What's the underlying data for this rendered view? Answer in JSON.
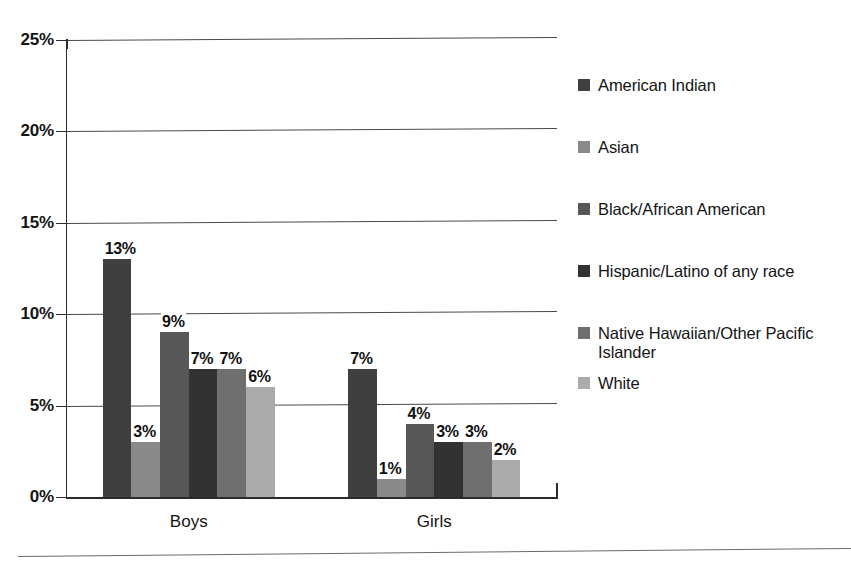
{
  "chart_data": {
    "type": "bar",
    "title": "",
    "subtitle": "",
    "xlabel": "",
    "ylabel": "",
    "categories": [
      "Boys",
      "Girls"
    ],
    "ylim": [
      0,
      25
    ],
    "ytick_values": [
      0,
      5,
      10,
      15,
      20,
      25
    ],
    "ytick_labels": [
      "0%",
      "5%",
      "10%",
      "15%",
      "20%",
      "25%"
    ],
    "grid": true,
    "grid_axis": "y",
    "legend_position": "right",
    "value_suffix": "%",
    "series": [
      {
        "name": "American Indian",
        "color": "#3f3f3f",
        "values": [
          13,
          7
        ],
        "labels": [
          "13%",
          "7%"
        ]
      },
      {
        "name": "Asian",
        "color": "#8a8a8a",
        "values": [
          3,
          1
        ],
        "labels": [
          "3%",
          "1%"
        ]
      },
      {
        "name": "Black/African American",
        "color": "#575757",
        "values": [
          9,
          4
        ],
        "labels": [
          "9%",
          "4%"
        ]
      },
      {
        "name": "Hispanic/Latino of any race",
        "color": "#323232",
        "values": [
          7,
          3
        ],
        "labels": [
          "7%",
          "3%"
        ]
      },
      {
        "name": "Native Hawaiian/Other Pacific Islander",
        "color": "#6f6f6f",
        "values": [
          7,
          3
        ],
        "labels": [
          "7%",
          "3%"
        ]
      },
      {
        "name": "White",
        "color": "#ababab",
        "values": [
          6,
          2
        ],
        "labels": [
          "6%",
          "2%"
        ]
      }
    ]
  },
  "axis": {
    "y_labels": [
      "25%",
      "20%",
      "15%",
      "10%",
      "5%",
      "0%"
    ]
  },
  "groups": [
    {
      "label": "Boys"
    },
    {
      "label": "Girls"
    }
  ],
  "legend": {
    "items": [
      {
        "label": "American Indian",
        "color": "#3f3f3f"
      },
      {
        "label": "Asian",
        "color": "#8a8a8a"
      },
      {
        "label": "Black/African American",
        "color": "#575757"
      },
      {
        "label": "Hispanic/Latino of any race",
        "color": "#323232"
      },
      {
        "label": "Native Hawaiian/Other Pacific Islander",
        "color": "#6f6f6f"
      },
      {
        "label": "White",
        "color": "#ababab"
      }
    ]
  }
}
